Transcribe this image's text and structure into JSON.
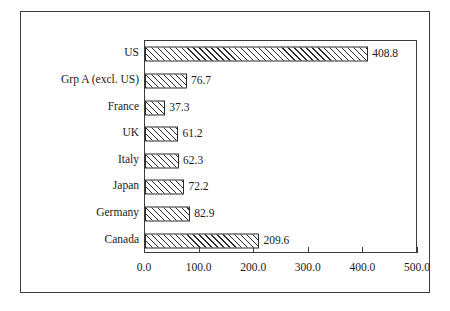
{
  "chart_data": {
    "type": "bar",
    "orientation": "horizontal",
    "title": "",
    "subtitle": "",
    "xlabel": "",
    "ylabel": "",
    "categories": [
      "US",
      "Grp A (excl. US)",
      "France",
      "UK",
      "Italy",
      "Japan",
      "Germany",
      "Canada"
    ],
    "values": [
      408.8,
      76.7,
      37.3,
      61.2,
      62.3,
      72.2,
      82.9,
      209.6
    ],
    "value_labels": [
      "408.8",
      "76.7",
      "37.3",
      "61.2",
      "62.3",
      "72.2",
      "82.9",
      "209.6"
    ],
    "xlim": [
      0.0,
      500.0
    ],
    "xticks": [
      0.0,
      100.0,
      200.0,
      300.0,
      400.0,
      500.0
    ],
    "xtick_labels": [
      "0.0",
      "100.0",
      "200.0",
      "300.0",
      "400.0",
      "500.0"
    ],
    "grid": false,
    "legend": null,
    "legend_position": "none",
    "bar_fill": "#ffffff",
    "bar_pattern": "diagonal-hatch",
    "bar_edge_color": "#2b2b2b",
    "axis_color": "#3d3d3d",
    "background_color": "#ffffff",
    "annotations": []
  }
}
